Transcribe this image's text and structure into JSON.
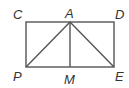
{
  "diagram": {
    "type": "geometry",
    "stroke_color": "#555555",
    "label_color": "#333333",
    "points": {
      "C": {
        "label": "C",
        "x": 26,
        "y": 22
      },
      "A": {
        "label": "A",
        "x": 70,
        "y": 22
      },
      "D": {
        "label": "D",
        "x": 114,
        "y": 22
      },
      "P": {
        "label": "P",
        "x": 26,
        "y": 67
      },
      "M": {
        "label": "M",
        "x": 70,
        "y": 67
      },
      "E": {
        "label": "E",
        "x": 114,
        "y": 67
      }
    },
    "segments": [
      "CD",
      "DE",
      "EP",
      "PC",
      "AP",
      "AM",
      "AE"
    ]
  }
}
